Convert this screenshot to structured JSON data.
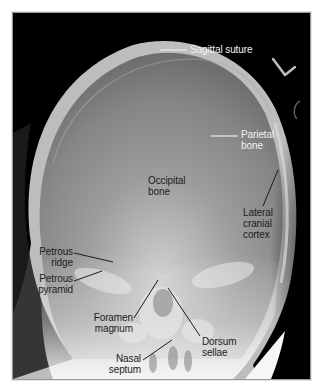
{
  "figure": {
    "marker": "L",
    "colors": {
      "background": "#000000",
      "bone_light": "#e8e8e8",
      "bone_mid": "#8a8a8a",
      "label_light": "#f2f2f2",
      "label_dark": "#1c1c1c",
      "frame": "#9a9a9a"
    }
  },
  "labels": {
    "sagittal_suture": "Sagittal suture",
    "parietal_bone_1": "Parietal",
    "parietal_bone_2": "bone",
    "occipital_bone_1": "Occipital",
    "occipital_bone_2": "bone",
    "lateral_cranial_cortex_1": "Lateral",
    "lateral_cranial_cortex_2": "cranial",
    "lateral_cranial_cortex_3": "cortex",
    "petrous_ridge_1": "Petrous",
    "petrous_ridge_2": "ridge",
    "petrous_pyramid_1": "Petrous",
    "petrous_pyramid_2": "pyramid",
    "foramen_magnum_1": "Foramen",
    "foramen_magnum_2": "magnum",
    "dorsum_sellae_1": "Dorsum",
    "dorsum_sellae_2": "sellae",
    "nasal_septum_1": "Nasal",
    "nasal_septum_2": "septum"
  }
}
